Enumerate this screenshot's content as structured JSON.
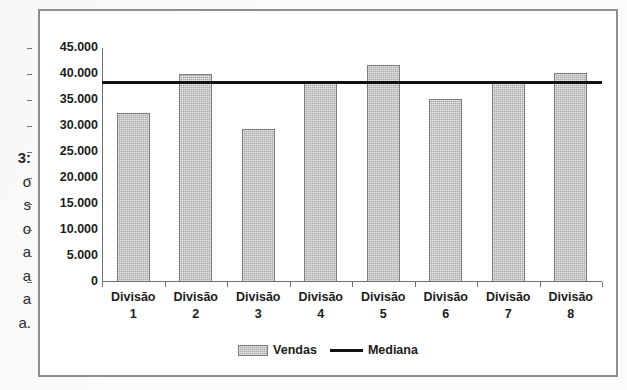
{
  "caption_fragment": {
    "lines": [
      "3:",
      "o",
      "s",
      "o",
      "a",
      "a",
      "a",
      "a."
    ]
  },
  "legend": {
    "bar_label": "Vendas",
    "line_label": "Mediana"
  },
  "colors": {
    "bar_fill": "#bcbcbc",
    "bar_border": "#7c7c7c",
    "median_line": "#111111",
    "axis": "#6f6f6f",
    "frame": "#8e8e8e",
    "text": "#1c1c1c"
  },
  "chart_data": {
    "type": "bar",
    "title": "",
    "xlabel": "",
    "ylabel": "",
    "categories": [
      "Divisão 1",
      "Divisão 2",
      "Divisão 3",
      "Divisão 4",
      "Divisão 5",
      "Divisão 6",
      "Divisão 7",
      "Divisão 8"
    ],
    "category_lines": [
      [
        "Divisão",
        "1"
      ],
      [
        "Divisão",
        "2"
      ],
      [
        "Divisão",
        "3"
      ],
      [
        "Divisão",
        "4"
      ],
      [
        "Divisão",
        "5"
      ],
      [
        "Divisão",
        "6"
      ],
      [
        "Divisão",
        "7"
      ],
      [
        "Divisão",
        "8"
      ]
    ],
    "series": [
      {
        "name": "Vendas",
        "type": "bar",
        "values": [
          32500,
          40000,
          29500,
          38300,
          41700,
          35200,
          38300,
          40200
        ]
      },
      {
        "name": "Mediana",
        "type": "line",
        "value": 38400
      }
    ],
    "ylim": [
      0,
      45000
    ],
    "ytick_values": [
      45000,
      40000,
      35000,
      30000,
      25000,
      20000,
      15000,
      10000,
      5000,
      0
    ],
    "ytick_labels": [
      "45.000",
      "40.000",
      "35.000",
      "30.000",
      "25.000",
      "20.000",
      "15.000",
      "10.000",
      "5.000",
      "0"
    ],
    "grid": false,
    "legend_position": "bottom"
  }
}
